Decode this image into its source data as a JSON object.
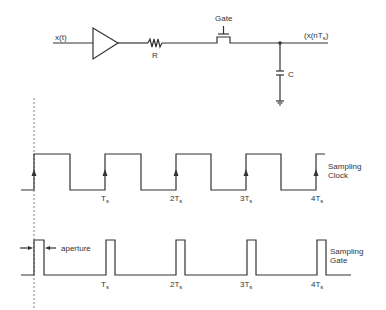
{
  "circuit": {
    "input_label": "x(t)",
    "resistor_label": "R",
    "gate_label": "Gate",
    "output_label": "(x(nT",
    "output_label_sub": "s",
    "output_label_end": ")",
    "capacitor_label": "C",
    "components": [
      "buffer-amplifier",
      "resistor",
      "gate-switch",
      "capacitor",
      "ground"
    ]
  },
  "clock": {
    "label_line1": "Sampling",
    "label_line2": "Clock",
    "ticks": [
      {
        "main": "T",
        "pre": "",
        "sub": "s"
      },
      {
        "main": "T",
        "pre": "2",
        "sub": "s"
      },
      {
        "main": "T",
        "pre": "3",
        "sub": "s"
      },
      {
        "main": "T",
        "pre": "4",
        "sub": "s"
      }
    ]
  },
  "gate_signal": {
    "label_line1": "Sampling",
    "label_line2": "Gate",
    "aperture_label": "aperture",
    "ticks": [
      {
        "main": "T",
        "pre": "",
        "sub": "s"
      },
      {
        "main": "T",
        "pre": "2",
        "sub": "s"
      },
      {
        "main": "T",
        "pre": "3",
        "sub": "s"
      },
      {
        "main": "T",
        "pre": "4",
        "sub": "s"
      }
    ]
  },
  "colors": {
    "line": "#333333",
    "background": "#ffffff"
  }
}
